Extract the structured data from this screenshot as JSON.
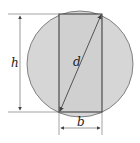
{
  "diagram": {
    "labels": {
      "height": "h",
      "diagonal": "d",
      "base": "b"
    },
    "colors": {
      "circle_fill": "#d6d6d6",
      "rect_fill": "#d2d2d2",
      "stroke": "#333333",
      "dim_line": "#555555"
    }
  }
}
